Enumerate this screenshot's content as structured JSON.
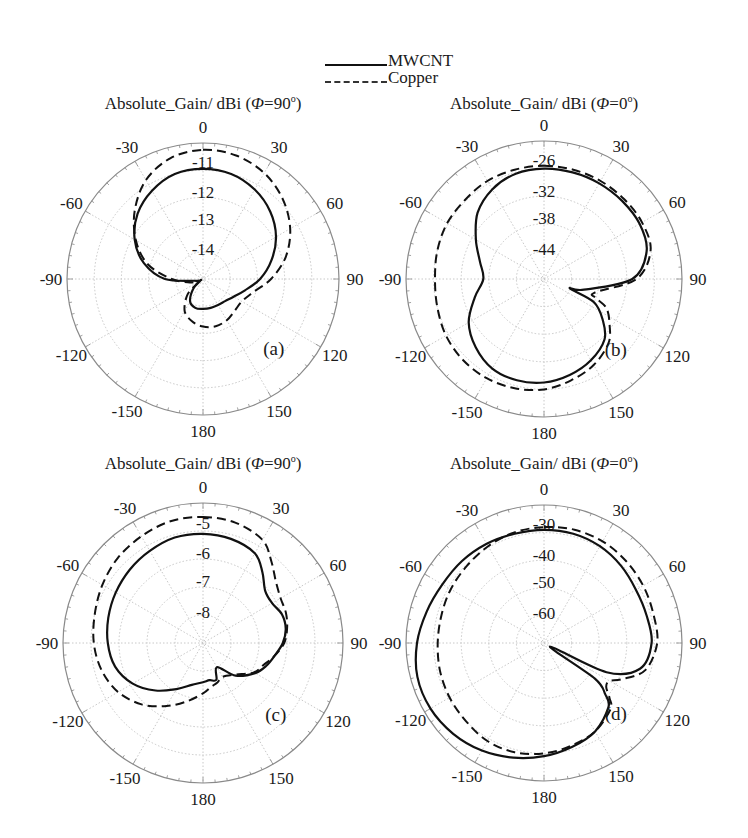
{
  "legend": {
    "items": [
      {
        "label": "MWCNT",
        "style": "solid"
      },
      {
        "label": "Copper",
        "style": "dashed"
      }
    ]
  },
  "colors": {
    "curve": "#111111",
    "grid": "#c8c8c8",
    "axis": "#8a8a8a",
    "text": "#1a1a1a"
  },
  "chart_data": [
    {
      "type": "polar",
      "id": "a",
      "panel_label": "(a)",
      "title_prefix": "Absolute_Gain/ dBi (",
      "title_phi": "Φ",
      "title_suffix": "=90",
      "title_deg": "o",
      "title_close": ")",
      "center": [
        203,
        279
      ],
      "radius": 136,
      "angle_labels": [
        "0",
        "30",
        "60",
        "90",
        "120",
        "150",
        "180",
        "-150",
        "-120",
        "-90",
        "-60",
        "-30"
      ],
      "radial_labels": [
        "-11",
        "-12",
        "-13",
        "-14"
      ],
      "rlim": [
        -15,
        -10.5
      ],
      "series": [
        {
          "name": "MWCNT",
          "style": "solid",
          "theta": [
            0,
            15,
            30,
            45,
            60,
            75,
            90,
            105,
            120,
            135,
            150,
            165,
            180,
            195,
            210,
            225,
            240,
            255,
            270,
            285,
            300,
            315,
            330,
            345
          ],
          "r_frac": [
            0.81,
            0.8,
            0.76,
            0.7,
            0.62,
            0.52,
            0.42,
            0.32,
            0.26,
            0.23,
            0.22,
            0.22,
            0.22,
            0.22,
            0.19,
            0.1,
            0.02,
            0.05,
            0.28,
            0.45,
            0.58,
            0.68,
            0.75,
            0.8
          ]
        },
        {
          "name": "Copper",
          "style": "dashed",
          "theta": [
            0,
            15,
            30,
            45,
            60,
            75,
            90,
            105,
            120,
            135,
            150,
            165,
            180,
            195,
            210,
            225,
            240,
            255,
            270,
            285,
            300,
            315,
            330,
            345
          ],
          "r_frac": [
            0.95,
            0.94,
            0.9,
            0.83,
            0.74,
            0.63,
            0.5,
            0.38,
            0.33,
            0.33,
            0.35,
            0.36,
            0.35,
            0.32,
            0.27,
            0.16,
            0.04,
            0.1,
            0.23,
            0.42,
            0.57,
            0.71,
            0.84,
            0.92
          ]
        }
      ]
    },
    {
      "type": "polar",
      "id": "b",
      "panel_label": "(b)",
      "title_prefix": "Absolute_Gain/ dBi (",
      "title_phi": "Φ",
      "title_suffix": "=0",
      "title_deg": "o",
      "title_close": ")",
      "center": [
        544,
        279
      ],
      "radius": 138,
      "angle_labels": [
        "0",
        "30",
        "60",
        "90",
        "120",
        "150",
        "180",
        "-150",
        "-120",
        "-90",
        "-60",
        "-30"
      ],
      "radial_labels": [
        "-26",
        "-32",
        "-38",
        "-44"
      ],
      "rlim": [
        -50,
        -20
      ],
      "series": [
        {
          "name": "MWCNT",
          "style": "solid",
          "theta": [
            0,
            15,
            30,
            45,
            60,
            75,
            90,
            105,
            110,
            115,
            125,
            135,
            150,
            165,
            180,
            195,
            210,
            225,
            240,
            255,
            270,
            285,
            300,
            315,
            330,
            345
          ],
          "r_frac": [
            0.8,
            0.8,
            0.8,
            0.8,
            0.8,
            0.77,
            0.64,
            0.3,
            0.2,
            0.4,
            0.52,
            0.62,
            0.68,
            0.72,
            0.75,
            0.76,
            0.75,
            0.7,
            0.63,
            0.52,
            0.44,
            0.48,
            0.57,
            0.68,
            0.75,
            0.79
          ]
        },
        {
          "name": "Copper",
          "style": "dashed",
          "theta": [
            0,
            15,
            30,
            45,
            60,
            75,
            90,
            105,
            110,
            115,
            125,
            135,
            150,
            165,
            180,
            195,
            210,
            225,
            240,
            255,
            270,
            285,
            300,
            315,
            330,
            345
          ],
          "r_frac": [
            0.82,
            0.82,
            0.82,
            0.82,
            0.82,
            0.8,
            0.67,
            0.38,
            0.4,
            0.5,
            0.58,
            0.66,
            0.72,
            0.76,
            0.8,
            0.82,
            0.83,
            0.83,
            0.82,
            0.8,
            0.79,
            0.8,
            0.81,
            0.81,
            0.82,
            0.82
          ]
        }
      ]
    },
    {
      "type": "polar",
      "id": "c",
      "panel_label": "(c)",
      "title_prefix": "Absolute_Gain/ dBi (",
      "title_phi": "Φ",
      "title_suffix": "=90",
      "title_deg": "o",
      "title_close": ")",
      "center": [
        203,
        643
      ],
      "radius": 140,
      "angle_labels": [
        "0",
        "30",
        "60",
        "90",
        "120",
        "150",
        "180",
        "-150",
        "-120",
        "-90",
        "-60",
        "-30"
      ],
      "radial_labels": [
        "-5",
        "-6",
        "-7",
        "-8"
      ],
      "rlim": [
        -9,
        -4.5
      ],
      "series": [
        {
          "name": "MWCNT",
          "style": "solid",
          "theta": [
            0,
            15,
            30,
            40,
            50,
            60,
            70,
            80,
            90,
            100,
            110,
            120,
            135,
            150,
            160,
            170,
            180,
            195,
            210,
            225,
            240,
            255,
            270,
            285,
            300,
            315,
            330,
            345
          ],
          "r_frac": [
            0.78,
            0.77,
            0.74,
            0.66,
            0.58,
            0.57,
            0.6,
            0.6,
            0.57,
            0.52,
            0.48,
            0.43,
            0.33,
            0.2,
            0.28,
            0.27,
            0.28,
            0.31,
            0.38,
            0.48,
            0.58,
            0.65,
            0.68,
            0.7,
            0.72,
            0.74,
            0.76,
            0.78
          ]
        },
        {
          "name": "Copper",
          "style": "dashed",
          "theta": [
            0,
            15,
            30,
            40,
            50,
            60,
            70,
            80,
            90,
            100,
            110,
            120,
            135,
            150,
            160,
            170,
            180,
            195,
            210,
            225,
            240,
            255,
            270,
            285,
            300,
            315,
            330,
            345
          ],
          "r_frac": [
            0.9,
            0.89,
            0.85,
            0.76,
            0.68,
            0.64,
            0.63,
            0.61,
            0.58,
            0.52,
            0.46,
            0.42,
            0.32,
            0.28,
            0.3,
            0.32,
            0.36,
            0.43,
            0.52,
            0.62,
            0.7,
            0.75,
            0.78,
            0.8,
            0.83,
            0.86,
            0.88,
            0.9
          ]
        }
      ]
    },
    {
      "type": "polar",
      "id": "d",
      "panel_label": "(d)",
      "title_prefix": "Absolute_Gain/ dBi (",
      "title_phi": "Φ",
      "title_suffix": "=0",
      "title_deg": "o",
      "title_close": ")",
      "center": [
        544,
        643
      ],
      "radius": 138,
      "angle_labels": [
        "0",
        "30",
        "60",
        "90",
        "120",
        "150",
        "180",
        "-150",
        "-120",
        "-90",
        "-60",
        "-30"
      ],
      "radial_labels": [
        "-30",
        "-40",
        "-50",
        "-60"
      ],
      "rlim": [
        -70,
        -25
      ],
      "series": [
        {
          "name": "MWCNT",
          "style": "solid",
          "theta": [
            0,
            15,
            30,
            45,
            60,
            75,
            90,
            105,
            115,
            120,
            125,
            130,
            135,
            150,
            165,
            180,
            195,
            210,
            225,
            240,
            255,
            270,
            285,
            300,
            315,
            330,
            345
          ],
          "r_frac": [
            0.82,
            0.82,
            0.81,
            0.79,
            0.77,
            0.77,
            0.78,
            0.72,
            0.5,
            0.05,
            0.45,
            0.58,
            0.66,
            0.74,
            0.78,
            0.82,
            0.86,
            0.9,
            0.93,
            0.95,
            0.95,
            0.92,
            0.88,
            0.85,
            0.84,
            0.83,
            0.82
          ]
        },
        {
          "name": "Copper",
          "style": "dashed",
          "theta": [
            0,
            15,
            30,
            45,
            60,
            75,
            90,
            105,
            115,
            120,
            125,
            130,
            135,
            150,
            165,
            180,
            195,
            210,
            225,
            240,
            255,
            270,
            285,
            300,
            315,
            330,
            345
          ],
          "r_frac": [
            0.84,
            0.85,
            0.85,
            0.84,
            0.83,
            0.82,
            0.82,
            0.76,
            0.62,
            0.55,
            0.55,
            0.62,
            0.68,
            0.74,
            0.77,
            0.8,
            0.82,
            0.82,
            0.8,
            0.79,
            0.78,
            0.77,
            0.77,
            0.78,
            0.79,
            0.81,
            0.83
          ]
        }
      ]
    }
  ]
}
